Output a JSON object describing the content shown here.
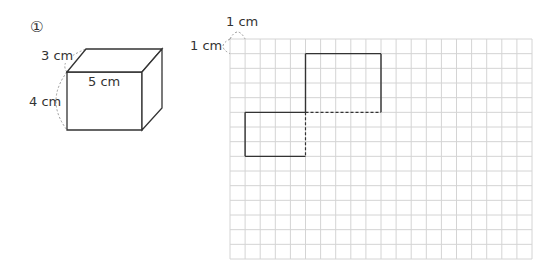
{
  "problem": {
    "number_label": "①"
  },
  "cuboid": {
    "depth_label": "3 cm",
    "width_label": "5 cm",
    "height_label": "4 cm",
    "dimensions_cm": {
      "width": 5,
      "depth": 3,
      "height": 4
    }
  },
  "grid": {
    "unit_label_top": "1 cm",
    "unit_label_left": "1 cm",
    "columns": 20,
    "rows": 15
  },
  "net_drawing": {
    "upper_rectangle": {
      "col": 5,
      "row": 1,
      "width_cells": 5,
      "height_cells": 4
    },
    "lower_rectangle": {
      "col": 1,
      "row": 5,
      "width_cells": 4,
      "height_cells": 3
    }
  }
}
